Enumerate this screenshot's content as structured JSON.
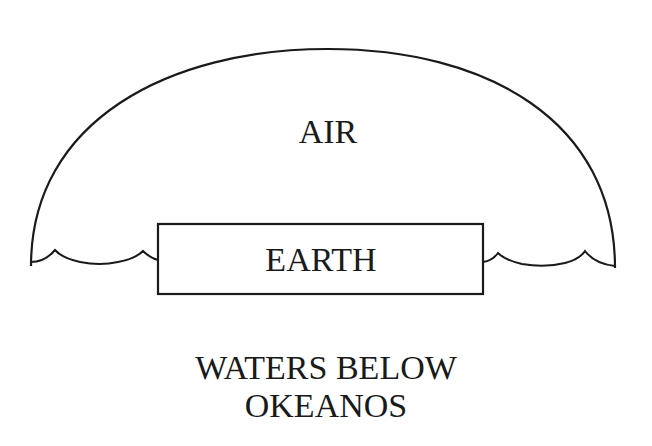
{
  "diagram": {
    "type": "cosmology-schematic",
    "stroke_color": "#1a1a1a",
    "background": "#ffffff",
    "labels": {
      "air": "AIR",
      "earth": "EARTH",
      "waters_line1": "WATERS BELOW",
      "waters_line2": "OKEANOS"
    },
    "shapes": {
      "dome": "semi-elliptical arc enclosing AIR",
      "earth_box": "rectangle labeled EARTH",
      "waves_left": "wavy water line between dome edge and earth box (left)",
      "waves_right": "wavy water line between earth box and dome edge (right)"
    }
  }
}
